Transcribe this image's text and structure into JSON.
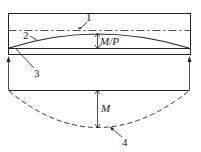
{
  "labels": {
    "one": "1",
    "two": "2",
    "three": "3",
    "four": "4",
    "eccentricity": "M/P",
    "moment": "M"
  },
  "colors": {
    "stroke": "#222222",
    "background": "#ffffff"
  }
}
